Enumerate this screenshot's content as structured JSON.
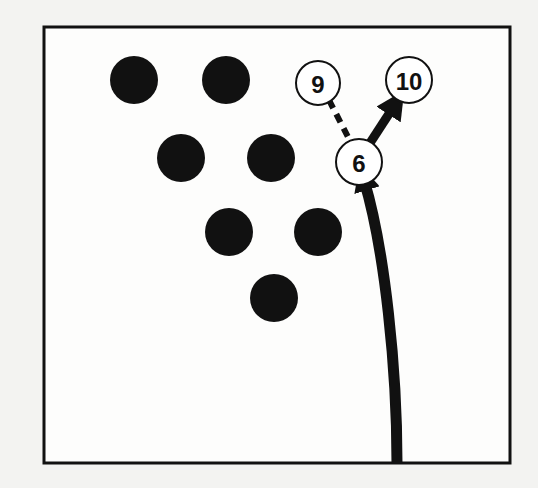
{
  "diagram": {
    "frame": {
      "x": 44,
      "y": 27,
      "width": 466,
      "height": 436,
      "stroke": "#111111"
    },
    "colors": {
      "background": "#f3f3f1",
      "ink": "#111111",
      "pin_fill_open": "#ffffff"
    },
    "standing_pins_filled": [
      {
        "id": "pin-7",
        "cx": 134,
        "cy": 80,
        "r": 24
      },
      {
        "id": "pin-8",
        "cx": 226,
        "cy": 80,
        "r": 24
      },
      {
        "id": "pin-4",
        "cx": 181,
        "cy": 158,
        "r": 24
      },
      {
        "id": "pin-5",
        "cx": 271,
        "cy": 158,
        "r": 24
      },
      {
        "id": "pin-2",
        "cx": 229,
        "cy": 232,
        "r": 24
      },
      {
        "id": "pin-3",
        "cx": 318,
        "cy": 232,
        "r": 24
      },
      {
        "id": "pin-1",
        "cx": 274,
        "cy": 298,
        "r": 24
      }
    ],
    "labeled_pins": [
      {
        "id": "pin-9",
        "label": "9",
        "cx": 318,
        "cy": 83,
        "r": 22,
        "font_size": 24
      },
      {
        "id": "pin-10",
        "label": "10",
        "cx": 409,
        "cy": 80,
        "r": 23,
        "font_size": 24
      },
      {
        "id": "pin-6",
        "label": "6",
        "cx": 359,
        "cy": 162,
        "r": 23,
        "font_size": 24
      }
    ],
    "paths": {
      "ball_path": {
        "d": "M 397 463 C 397 370, 385 250, 364 180",
        "stroke_width": 11
      },
      "deflection_6_to_10": {
        "x1": 370,
        "y1": 143,
        "x2": 398,
        "y2": 100,
        "stroke_width": 9
      },
      "deflection_6_to_9": {
        "x1": 329,
        "y1": 100,
        "x2": 349,
        "y2": 139,
        "stroke_width": 6,
        "dash": "9,7"
      }
    }
  }
}
